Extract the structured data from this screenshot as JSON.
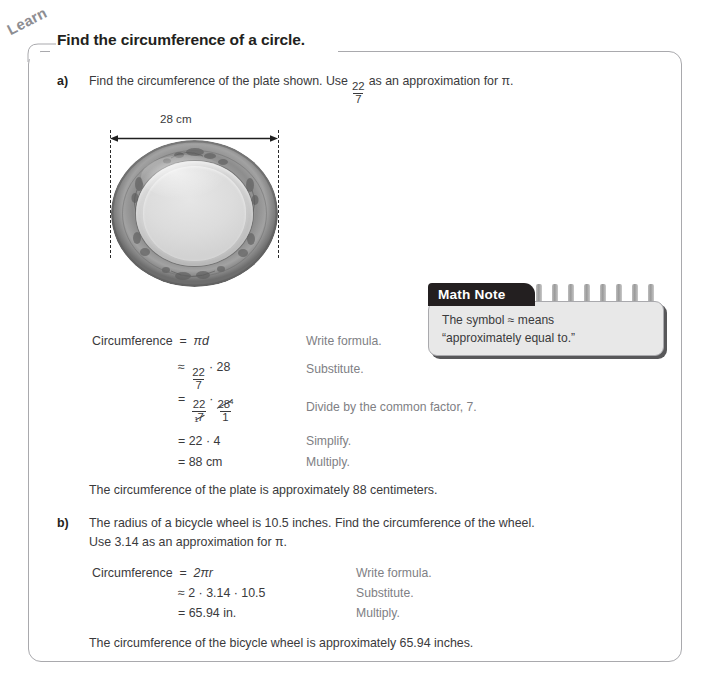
{
  "page": {
    "tab_label": "Learn",
    "heading": "Find the circumference of a circle."
  },
  "part_a": {
    "label": "a)",
    "prompt_before_fraction": "Find the circumference of the plate shown. Use",
    "fraction": {
      "numerator": "22",
      "denominator": "7"
    },
    "prompt_after_fraction": "as an approximation for π.",
    "figure": {
      "dimension_label": "28 cm",
      "image_alt": "plate-photo"
    },
    "work": [
      {
        "lhs": "Circumference",
        "relation": "=",
        "expression": "πd",
        "annotation": "Write formula."
      },
      {
        "lhs": "",
        "relation": "≈",
        "expression": "22/7 · 28",
        "annotation": "Substitute."
      },
      {
        "lhs": "",
        "relation": "=",
        "expression": "22/7̸₁ · 2̈8⁴/1",
        "annotation": "Divide by the common factor, 7."
      },
      {
        "lhs": "",
        "relation": "=",
        "expression": "22 · 4",
        "annotation": "Simplify."
      },
      {
        "lhs": "",
        "relation": "=",
        "expression": "88 cm",
        "annotation": "Multiply."
      }
    ],
    "work_tokens": {
      "line1_expr": "πd",
      "line2_mult": "· 28",
      "line3_num1": "22",
      "line3_den1": "7",
      "line3_den1_sub": "1",
      "line3_num2": "28",
      "line3_num2_sup": "4",
      "line3_den2": "1",
      "line3_dot": "·",
      "line4_expr": "22 · 4",
      "line5_expr": "88 cm",
      "frac_num": "22",
      "frac_den": "7"
    },
    "conclusion": "The circumference of the plate is approximately 88 centimeters."
  },
  "math_note": {
    "tab_label": "Math Note",
    "line1": "The symbol ≈ means",
    "line2": "“approximately equal to.”",
    "ring_count": 8
  },
  "part_b": {
    "label": "b)",
    "prompt_line1": "The radius of a bicycle wheel is 10.5 inches. Find the circumference of the wheel.",
    "prompt_line2": "Use 3.14 as an approximation for π.",
    "work": [
      {
        "lhs": "Circumference",
        "relation": "=",
        "expression": "2πr",
        "annotation": "Write formula."
      },
      {
        "lhs": "",
        "relation": "≈",
        "expression": "2 · 3.14 · 10.5",
        "annotation": "Substitute."
      },
      {
        "lhs": "",
        "relation": "=",
        "expression": "65.94 in.",
        "annotation": "Multiply."
      }
    ],
    "work_tokens": {
      "lhs": "Circumference",
      "line1_expr": "2πr",
      "line2_expr": "2 · 3.14 · 10.5",
      "line3_expr": "65.94 in."
    },
    "conclusion": "The circumference of the bicycle wheel is approximately 65.94 inches."
  },
  "colors": {
    "frame": "#a9a9ad",
    "text": "#3a3a3c",
    "heading": "#231f20",
    "annotation": "#808084",
    "note_tab_bg": "#231f20",
    "note_body_bg": "#e8e8e8",
    "tab_label": "#8d8d92"
  }
}
